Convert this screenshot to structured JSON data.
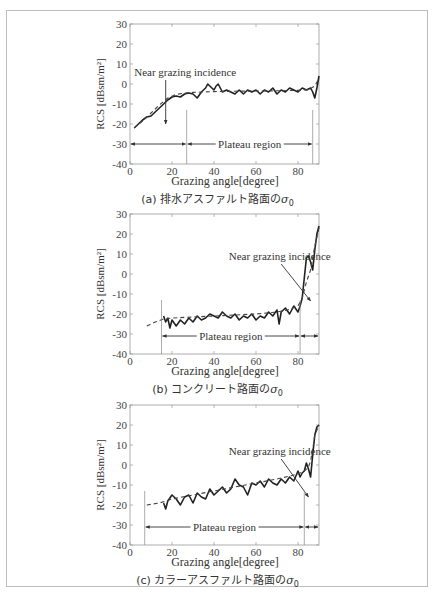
{
  "figure": {
    "panels": [
      {
        "id": "a",
        "caption_prefix": "(a) 排水アスファルト路面の",
        "caption_symbol": "σ",
        "caption_sub": "0",
        "xlabel": "Grazing angle[degree]",
        "ylabel": "RCS [dBsm/m²]"
      },
      {
        "id": "b",
        "caption_prefix": "(b) コンクリート路面の",
        "caption_symbol": "σ",
        "caption_sub": "0",
        "xlabel": "Grazing angle[degree]",
        "ylabel": "RCS [dBsm/m²]"
      },
      {
        "id": "c",
        "caption_prefix": "(c) カラーアスファルト路面の",
        "caption_symbol": "σ",
        "caption_sub": "0",
        "xlabel": "Grazing angle[degree]",
        "ylabel": "RCS [dBsm/m²]"
      }
    ]
  },
  "chart_data": [
    {
      "type": "line",
      "title": "(a) 排水アスファルト路面の σ0",
      "xlabel": "Grazing angle[degree]",
      "ylabel": "RCS [dBsm/m²]",
      "xlim": [
        0,
        90
      ],
      "ylim": [
        -40,
        30
      ],
      "xticks": [
        0,
        20,
        40,
        60,
        80
      ],
      "yticks": [
        -40,
        -30,
        -20,
        -10,
        0,
        10,
        20,
        30
      ],
      "grid": false,
      "series": [
        {
          "name": "measured",
          "style": "solid",
          "x": [
            2,
            4,
            6,
            8,
            10,
            12,
            14,
            16,
            18,
            20,
            22,
            24,
            26,
            28,
            30,
            32,
            34,
            36,
            37,
            38,
            40,
            41,
            42,
            44,
            46,
            48,
            50,
            52,
            54,
            56,
            58,
            60,
            62,
            64,
            66,
            68,
            70,
            72,
            74,
            76,
            78,
            80,
            82,
            84,
            86,
            87,
            88,
            89,
            90
          ],
          "y": [
            -22,
            -20,
            -18,
            -16.5,
            -16,
            -14,
            -12,
            -10,
            -8,
            -6.5,
            -6,
            -6.5,
            -5,
            -4.5,
            -5,
            -7,
            -4,
            -2,
            0,
            -1,
            -3,
            -1,
            0,
            -4,
            -3,
            -4,
            -5,
            -3,
            -5,
            -3,
            -4,
            -3,
            -5,
            -3,
            -4,
            -2,
            -5,
            -3,
            -4,
            -2,
            -3,
            -4,
            -2,
            -3,
            -2,
            -4,
            -7,
            -2,
            4
          ]
        },
        {
          "name": "fit",
          "style": "dashed",
          "x": [
            2,
            6,
            10,
            14,
            18,
            22,
            26,
            30,
            40,
            50,
            60,
            70,
            80,
            85,
            88,
            90
          ],
          "y": [
            -22,
            -18.5,
            -14.5,
            -10.5,
            -7,
            -5.2,
            -4.5,
            -4.2,
            -3.8,
            -3.6,
            -3.5,
            -3.4,
            -3.2,
            -2.8,
            -1,
            3
          ]
        }
      ],
      "annotations": [
        {
          "text": "Near grazing incidence",
          "x": 2,
          "y": 4,
          "arrow_to": [
            17,
            -20
          ]
        },
        {
          "text": "Plateau region",
          "from": 27,
          "to": 87,
          "y": -30
        },
        {
          "region_left": [
            0,
            27
          ],
          "y": -30
        },
        {
          "vlines": [
            27,
            87
          ]
        }
      ]
    },
    {
      "type": "line",
      "title": "(b) コンクリート路面の σ0",
      "xlabel": "Grazing angle[degree]",
      "ylabel": "RCS [dBsm/m²]",
      "xlim": [
        0,
        90
      ],
      "ylim": [
        -40,
        30
      ],
      "xticks": [
        0,
        20,
        40,
        60,
        80
      ],
      "yticks": [
        -40,
        -30,
        -20,
        -10,
        0,
        10,
        20,
        30
      ],
      "grid": false,
      "series": [
        {
          "name": "measured",
          "style": "solid",
          "x": [
            16,
            17,
            18,
            19,
            20,
            22,
            24,
            26,
            28,
            30,
            32,
            34,
            36,
            38,
            40,
            42,
            44,
            46,
            48,
            50,
            52,
            54,
            56,
            58,
            60,
            62,
            64,
            66,
            68,
            70,
            71,
            72,
            74,
            76,
            78,
            80,
            81,
            82,
            83,
            84,
            85,
            86,
            87,
            88,
            89,
            90
          ],
          "y": [
            -21,
            -24,
            -22,
            -27,
            -23,
            -26,
            -23,
            -25,
            -22,
            -24,
            -21,
            -23,
            -22,
            -20,
            -21,
            -22,
            -19,
            -21,
            -22,
            -20,
            -23,
            -21,
            -22,
            -20,
            -23,
            -21,
            -22,
            -19,
            -21,
            -18,
            -25,
            -19,
            -17,
            -20,
            -16,
            -19,
            -16,
            -12,
            -2,
            8,
            9,
            6,
            2,
            12,
            20,
            24
          ]
        },
        {
          "name": "fit",
          "style": "dashed",
          "x": [
            8,
            12,
            16,
            20,
            30,
            40,
            50,
            60,
            70,
            75,
            80,
            82,
            84,
            86,
            88,
            90
          ],
          "y": [
            -26,
            -24,
            -22.5,
            -22,
            -21.5,
            -21,
            -20.5,
            -20,
            -19,
            -18,
            -16,
            -12,
            -4,
            2,
            14,
            23
          ]
        }
      ],
      "annotations": [
        {
          "text": "Near grazing incidence",
          "x": 47,
          "y": 7,
          "arrow_to": [
            86,
            -13.5
          ]
        },
        {
          "text": "Plateau region",
          "from": 15,
          "to": 81,
          "y": -31
        },
        {
          "region_right": [
            81,
            90
          ],
          "y": -31
        },
        {
          "vlines": [
            15,
            81
          ]
        }
      ]
    },
    {
      "type": "line",
      "title": "(c) カラーアスファルト路面の σ0",
      "xlabel": "Grazing angle[degree]",
      "ylabel": "RCS [dBsm/m²]",
      "xlim": [
        0,
        90
      ],
      "ylim": [
        -40,
        30
      ],
      "xticks": [
        0,
        20,
        40,
        60,
        80
      ],
      "yticks": [
        -40,
        -30,
        -20,
        -10,
        0,
        10,
        20,
        30
      ],
      "grid": false,
      "series": [
        {
          "name": "measured",
          "style": "solid",
          "x": [
            16,
            17,
            18,
            20,
            22,
            24,
            26,
            28,
            30,
            32,
            34,
            36,
            38,
            40,
            42,
            44,
            46,
            48,
            50,
            52,
            54,
            56,
            58,
            60,
            62,
            64,
            66,
            68,
            70,
            72,
            74,
            76,
            78,
            80,
            81,
            82,
            83,
            84,
            85,
            86,
            87,
            88,
            89,
            90
          ],
          "y": [
            -19,
            -22,
            -18,
            -15,
            -17,
            -20,
            -16,
            -15,
            -19,
            -14,
            -16,
            -17,
            -12,
            -15,
            -13,
            -11,
            -14,
            -12,
            -7,
            -10,
            -11,
            -15,
            -9,
            -10,
            -8,
            -11,
            -7,
            -9,
            -10,
            -7,
            -9,
            -6,
            -8,
            -3,
            -6,
            -4,
            -3,
            1,
            -2,
            -6,
            5,
            15,
            19,
            20
          ]
        },
        {
          "name": "fit",
          "style": "dashed",
          "x": [
            8,
            14,
            20,
            30,
            40,
            50,
            60,
            70,
            80,
            83,
            85,
            86,
            87,
            88,
            90
          ],
          "y": [
            -20,
            -19,
            -17,
            -15,
            -13,
            -11,
            -9,
            -7,
            -4.5,
            -3,
            -1,
            2,
            8,
            15,
            20
          ]
        }
      ],
      "annotations": [
        {
          "text": "Near grazing incidence",
          "x": 47,
          "y": 5,
          "arrow_to": [
            85,
            -16
          ]
        },
        {
          "text": "Plateau region",
          "from": 7,
          "to": 83,
          "y": -31
        },
        {
          "region_right": [
            83,
            90
          ],
          "y": -31
        },
        {
          "vlines": [
            7,
            83
          ]
        }
      ]
    }
  ]
}
